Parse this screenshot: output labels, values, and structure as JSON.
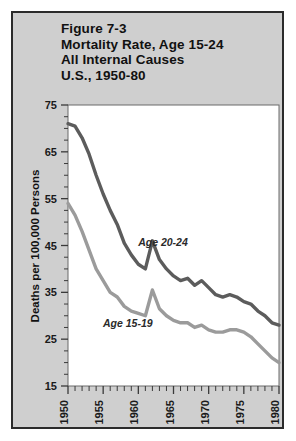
{
  "figure": {
    "title_lines": [
      "Figure 7-3",
      "Mortality Rate, Age 15-24",
      "All Internal Causes",
      "U.S., 1950-80"
    ],
    "title_line_1": "Figure 7-3",
    "title_line_2": "Mortality Rate, Age 15-24",
    "title_line_3": "All Internal Causes",
    "title_line_4": "U.S., 1950-80",
    "background_color": "#cfcfcf",
    "border_color": "#2b2b2b",
    "plot_background": "#ffffff"
  },
  "chart_data": {
    "type": "line",
    "title": "Figure 7-3 Mortality Rate, Age 15-24 All Internal Causes U.S., 1950-80",
    "xlabel": "",
    "ylabel": "Deaths per 100,000 Persons",
    "xlim": [
      1950,
      1980
    ],
    "ylim": [
      15,
      75
    ],
    "ytick_values": [
      15,
      25,
      35,
      45,
      55,
      65,
      75
    ],
    "ytick_labels": [
      "15",
      "25",
      "35",
      "45",
      "55",
      "65",
      "75"
    ],
    "y_minor_step": 2.5,
    "xtick_values": [
      1950,
      1955,
      1960,
      1965,
      1970,
      1975,
      1980
    ],
    "xtick_labels": [
      "1950",
      "1955",
      "1960",
      "1965",
      "1970",
      "1975",
      "1980"
    ],
    "x_minor_step": 1,
    "xtick_label_rotation": -90,
    "grid": false,
    "legend": "inline-annotations",
    "x": [
      1950,
      1951,
      1952,
      1953,
      1954,
      1955,
      1956,
      1957,
      1958,
      1959,
      1960,
      1961,
      1962,
      1963,
      1964,
      1965,
      1966,
      1967,
      1968,
      1969,
      1970,
      1971,
      1972,
      1973,
      1974,
      1975,
      1976,
      1977,
      1978,
      1979,
      1980
    ],
    "series": [
      {
        "name": "Age 20-24",
        "color": "#5c5c5c",
        "label_text": "Age 20-24",
        "values": [
          71.0,
          70.5,
          68.0,
          64.5,
          60.0,
          56.0,
          52.5,
          49.5,
          45.5,
          43.0,
          41.0,
          40.0,
          46.0,
          42.0,
          40.0,
          38.5,
          37.5,
          38.0,
          36.5,
          37.5,
          36.0,
          34.5,
          34.0,
          34.5,
          34.0,
          33.0,
          32.5,
          31.0,
          30.0,
          28.5,
          28.0
        ]
      },
      {
        "name": "Age 15-19",
        "color": "#9b9b9b",
        "label_text": "Age 15-19",
        "values": [
          54.0,
          51.5,
          48.0,
          44.0,
          40.0,
          37.5,
          35.0,
          34.0,
          32.0,
          31.0,
          30.5,
          30.0,
          35.5,
          31.5,
          30.0,
          29.0,
          28.5,
          28.5,
          27.5,
          28.0,
          27.0,
          26.5,
          26.5,
          27.0,
          27.0,
          26.5,
          25.5,
          24.0,
          22.5,
          21.0,
          20.0
        ]
      }
    ],
    "annotations": [
      {
        "text": "Age 20-24",
        "x": 1963.5,
        "y": 45.0
      },
      {
        "text": "Age 15-19",
        "x": 1958.5,
        "y": 27.5
      }
    ]
  }
}
